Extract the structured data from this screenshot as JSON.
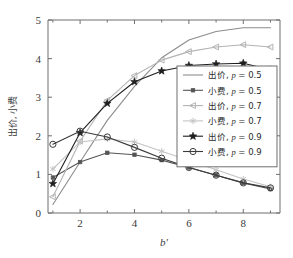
{
  "figure": {
    "background": "#ffffff",
    "width": 293,
    "height": 258
  },
  "axes": {
    "x_title": "b'",
    "y_title": "出价, 小费",
    "x_ticks": [
      "2",
      "4",
      "6",
      "8"
    ],
    "x_tick_values": [
      2,
      4,
      6,
      8
    ],
    "x_minor_values": [
      1,
      3,
      5,
      7,
      9
    ],
    "y_ticks": [
      "0",
      "1",
      "2",
      "3",
      "4",
      "5"
    ],
    "y_tick_values": [
      0,
      1,
      2,
      3,
      4,
      5
    ],
    "xlim": [
      0.82,
      9.35
    ],
    "ylim": [
      0,
      5
    ],
    "axis_color": "#6f6f6f",
    "grid": false
  },
  "legend": {
    "position": "center-right",
    "entries": [
      {
        "label_cjk": "出价",
        "param": "p",
        "eq": " = 0.5",
        "marker": "none",
        "color": "#8c8c8c"
      },
      {
        "label_cjk": "小费",
        "param": "p",
        "eq": " = 0.5",
        "marker": "square",
        "color": "#555555"
      },
      {
        "label_cjk": "出价",
        "param": "p",
        "eq": " = 0.7",
        "marker": "triangle-left",
        "color": "#b3b3b3"
      },
      {
        "label_cjk": "小费",
        "param": "p",
        "eq": " = 0.7",
        "marker": "asterisk",
        "color": "#c4c4c4"
      },
      {
        "label_cjk": "出价",
        "param": "p",
        "eq": " = 0.9",
        "marker": "star",
        "color": "#1f1f1f"
      },
      {
        "label_cjk": "小费",
        "param": "p",
        "eq": " = 0.9",
        "marker": "circle",
        "color": "#3b3b3b"
      }
    ]
  },
  "chart_data": {
    "type": "line",
    "title": "",
    "xlabel": "b'",
    "ylabel": "出价, 小费",
    "xlim": [
      0.82,
      9.35
    ],
    "ylim": [
      0,
      5
    ],
    "grid": false,
    "legend_position": "center-right",
    "x": [
      1,
      2,
      3,
      4,
      5,
      6,
      7,
      8,
      9
    ],
    "series": [
      {
        "name": "出价, p = 0.5",
        "label_cjk": "出价",
        "p": 0.5,
        "marker": "none",
        "color": "#8c8c8c",
        "values": [
          0.22,
          1.32,
          2.4,
          3.28,
          4.02,
          4.48,
          4.7,
          4.8,
          4.8
        ]
      },
      {
        "name": "小费, p = 0.5",
        "label_cjk": "小费",
        "p": 0.5,
        "marker": "square",
        "color": "#555555",
        "values": [
          0.92,
          1.32,
          1.56,
          1.51,
          1.37,
          1.18,
          0.98,
          0.78,
          0.62
        ]
      },
      {
        "name": "出价, p = 0.7",
        "label_cjk": "出价",
        "p": 0.7,
        "marker": "triangle-left",
        "color": "#b3b3b3",
        "values": [
          0.42,
          1.86,
          2.92,
          3.56,
          3.96,
          4.18,
          4.3,
          4.36,
          4.3
        ]
      },
      {
        "name": "小费, p = 0.7",
        "label_cjk": "小费",
        "p": 0.7,
        "marker": "asterisk",
        "color": "#c4c4c4",
        "values": [
          1.14,
          1.84,
          1.92,
          1.84,
          1.6,
          1.36,
          1.12,
          0.88,
          0.68
        ]
      },
      {
        "name": "出价, p = 0.9",
        "label_cjk": "出价",
        "p": 0.9,
        "marker": "star",
        "color": "#1f1f1f",
        "values": [
          0.76,
          2.08,
          2.84,
          3.4,
          3.68,
          3.82,
          3.86,
          3.88,
          3.71
        ]
      },
      {
        "name": "小费, p = 0.9",
        "label_cjk": "小费",
        "p": 0.9,
        "marker": "circle",
        "color": "#3b3b3b",
        "values": [
          1.78,
          2.12,
          1.97,
          1.7,
          1.42,
          1.18,
          0.98,
          0.78,
          0.65
        ]
      }
    ]
  }
}
